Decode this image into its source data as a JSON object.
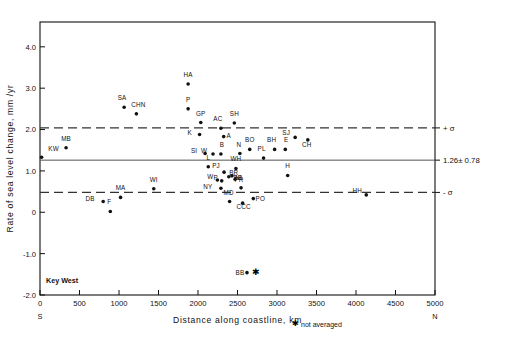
{
  "chart_data": {
    "type": "scatter",
    "title": "",
    "xlabel": "Distance along coastline, km",
    "ylabel": "Rate of sea level change, mm /yr",
    "xlim": [
      0,
      5000
    ],
    "ylim": [
      -2.0,
      4.6
    ],
    "xticks": [
      "0",
      "500",
      "1000",
      "1500",
      "2000",
      "2500",
      "3000",
      "3500",
      "4000",
      "4500",
      "5000"
    ],
    "xtick_values": [
      0,
      500,
      1000,
      1500,
      2000,
      2500,
      3000,
      3500,
      4000,
      4500,
      5000
    ],
    "yticks": [
      "4.0",
      "3.0",
      "2.0",
      "1.0",
      "0",
      "-1.0",
      "-2.0"
    ],
    "ytick_values": [
      4.0,
      3.0,
      2.0,
      1.0,
      0,
      -1.0,
      -2.0
    ],
    "grid": false,
    "legend_position": "below-right",
    "reference_lines": [
      {
        "name": "plus-sigma",
        "value": 2.04,
        "style": "dashed",
        "label": "+ σ"
      },
      {
        "name": "mean",
        "value": 1.26,
        "style": "solid",
        "label": "1.26± 0.78"
      },
      {
        "name": "minus-sigma",
        "value": 0.48,
        "style": "dashed",
        "label": "- σ"
      }
    ],
    "annotations": [
      {
        "name": "key-west-note",
        "text": "Key West",
        "x": 150,
        "y": -1.72
      },
      {
        "name": "south-end",
        "text": "S",
        "x": 0,
        "y": -2.28
      },
      {
        "name": "north-end",
        "text": "N",
        "x": 5000,
        "y": -2.28
      }
    ],
    "legend": [
      {
        "symbol": "asterisk",
        "label": "not averaged"
      }
    ],
    "points": [
      {
        "label": "KW",
        "x": 20,
        "y": 1.33,
        "lx": 12,
        "ly": -6,
        "not_averaged": false
      },
      {
        "label": "MB",
        "x": 330,
        "y": 1.56,
        "lx": 0,
        "ly": -7,
        "not_averaged": false
      },
      {
        "label": "DB",
        "x": 800,
        "y": 0.26,
        "lx": -13,
        "ly": -1,
        "not_averaged": false
      },
      {
        "label": "F",
        "x": 890,
        "y": 0.02,
        "lx": -1,
        "ly": -7,
        "not_averaged": false
      },
      {
        "label": "MA",
        "x": 1020,
        "y": 0.36,
        "lx": 0,
        "ly": -7,
        "not_averaged": false
      },
      {
        "label": "SA",
        "x": 1065,
        "y": 2.54,
        "lx": -2,
        "ly": -7,
        "not_averaged": false
      },
      {
        "label": "CHN",
        "x": 1220,
        "y": 2.38,
        "lx": 2,
        "ly": -7,
        "not_averaged": false
      },
      {
        "label": "WI",
        "x": 1440,
        "y": 0.57,
        "lx": 0,
        "ly": -7,
        "not_averaged": false
      },
      {
        "label": "HA",
        "x": 1875,
        "y": 3.1,
        "lx": 0,
        "ly": -7,
        "not_averaged": false
      },
      {
        "label": "P",
        "x": 1875,
        "y": 2.5,
        "lx": 0,
        "ly": -7,
        "not_averaged": false
      },
      {
        "label": "GP",
        "x": 2035,
        "y": 2.17,
        "lx": 0,
        "ly": -7,
        "not_averaged": false
      },
      {
        "label": "K",
        "x": 2020,
        "y": 1.88,
        "lx": -10,
        "ly": 0,
        "not_averaged": false
      },
      {
        "label": "SI",
        "x": 2090,
        "y": 1.42,
        "lx": -11,
        "ly": -1,
        "not_averaged": false
      },
      {
        "label": "W",
        "x": 2190,
        "y": 1.41,
        "lx": -9,
        "ly": -1,
        "not_averaged": false
      },
      {
        "label": "B",
        "x": 2290,
        "y": 1.41,
        "lx": 1,
        "ly": -7,
        "not_averaged": false
      },
      {
        "label": "AC",
        "x": 2290,
        "y": 2.03,
        "lx": -3,
        "ly": -7,
        "not_averaged": false
      },
      {
        "label": "A",
        "x": 2325,
        "y": 1.83,
        "lx": 5,
        "ly": 1,
        "not_averaged": false
      },
      {
        "label": "SH",
        "x": 2460,
        "y": 2.16,
        "lx": 0,
        "ly": -7,
        "not_averaged": false
      },
      {
        "label": "L",
        "x": 2130,
        "y": 1.1,
        "lx": 0,
        "ly": -7,
        "not_averaged": false
      },
      {
        "label": "N",
        "x": 2530,
        "y": 1.42,
        "lx": -1,
        "ly": -7,
        "not_averaged": false
      },
      {
        "label": "BO",
        "x": 2655,
        "y": 1.52,
        "lx": 0,
        "ly": -7,
        "not_averaged": false
      },
      {
        "label": "PL",
        "x": 2830,
        "y": 1.31,
        "lx": -2,
        "ly": -7,
        "not_averaged": false
      },
      {
        "label": "PJ",
        "x": 2330,
        "y": 0.97,
        "lx": -8,
        "ly": -4,
        "not_averaged": false
      },
      {
        "label": "WH",
        "x": 2480,
        "y": 1.06,
        "lx": 0,
        "ly": -7,
        "not_averaged": false
      },
      {
        "label": "BR",
        "x": 2390,
        "y": 0.86,
        "lx": 5,
        "ly": -2,
        "not_averaged": false
      },
      {
        "label": "BB",
        "x": 2430,
        "y": 0.88,
        "lx": 6,
        "ly": 4,
        "not_averaged": false
      },
      {
        "label": "W",
        "x": 2245,
        "y": 0.78,
        "lx": -7,
        "ly": -1,
        "not_averaged": false
      },
      {
        "label": "P",
        "x": 2300,
        "y": 0.76,
        "lx": -6,
        "ly": -1,
        "not_averaged": false
      },
      {
        "label": "NL",
        "x": 2470,
        "y": 0.8,
        "lx": 4,
        "ly": 1,
        "not_averaged": false
      },
      {
        "label": "NY",
        "x": 2290,
        "y": 0.58,
        "lx": -13,
        "ly": 1,
        "not_averaged": false
      },
      {
        "label": "PR",
        "x": 2545,
        "y": 0.59,
        "lx": -2,
        "ly": -6,
        "not_averaged": false
      },
      {
        "label": "MD",
        "x": 2400,
        "y": 0.26,
        "lx": -1,
        "ly": -7,
        "not_averaged": false
      },
      {
        "label": "CCC",
        "x": 2565,
        "y": 0.22,
        "lx": 1,
        "ly": 6,
        "not_averaged": false
      },
      {
        "label": "PO",
        "x": 2700,
        "y": 0.33,
        "lx": 7,
        "ly": 2,
        "not_averaged": false
      },
      {
        "label": "BH",
        "x": 2970,
        "y": 1.52,
        "lx": -3,
        "ly": -7,
        "not_averaged": false
      },
      {
        "label": "E",
        "x": 3105,
        "y": 1.52,
        "lx": 1,
        "ly": -7,
        "not_averaged": false
      },
      {
        "label": "SJ",
        "x": 3230,
        "y": 1.81,
        "lx": -9,
        "ly": -2,
        "not_averaged": false
      },
      {
        "label": "CH",
        "x": 3390,
        "y": 1.75,
        "lx": -1,
        "ly": 7,
        "not_averaged": false
      },
      {
        "label": "H",
        "x": 3135,
        "y": 0.89,
        "lx": 0,
        "ly": -7,
        "not_averaged": false
      },
      {
        "label": "HH",
        "x": 4130,
        "y": 0.42,
        "lx": -9,
        "ly": -2,
        "not_averaged": false
      },
      {
        "label": "BB",
        "x": 2620,
        "y": -1.46,
        "lx": -7,
        "ly": 2,
        "not_averaged": true
      }
    ]
  },
  "axis": {
    "xlabel": "Distance along coastline, km",
    "ylabel": "Rate of sea level change, mm /yr",
    "south": "S",
    "north": "N"
  },
  "legend_note": "not averaged",
  "key_west": "Key West",
  "sigma_labels": {
    "plus": "+ σ",
    "mean": "1.26± 0.78",
    "minus": "- σ"
  }
}
